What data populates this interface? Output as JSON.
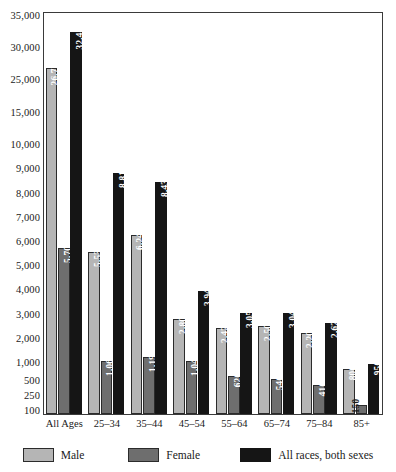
{
  "chart_data": {
    "type": "bar",
    "title": "",
    "subtitle": "",
    "xlabel": "",
    "ylabel": "",
    "grid": false,
    "legend_position": "bottom",
    "axis_note": "Non-linear (broken) y-axis: spacing compresses above 10,000 and expands below 1,000",
    "categories": [
      "All Ages",
      "25–34",
      "35–44",
      "45–54",
      "55–64",
      "65–74",
      "75–84",
      "85+"
    ],
    "ytick_labels": [
      "35,000",
      "30,000",
      "25,000",
      "15,000",
      "10,000",
      "9,000",
      "8,000",
      "7,000",
      "6,000",
      "5,000",
      "4,000",
      "3,000",
      "2,000",
      "1,000",
      "500",
      "250",
      "100"
    ],
    "ytick_values": [
      35000,
      30000,
      25000,
      15000,
      10000,
      9000,
      8000,
      7000,
      6000,
      5000,
      4000,
      3000,
      2000,
      1000,
      500,
      250,
      100
    ],
    "ytick_pixel_y": [
      16,
      48,
      80,
      113,
      145,
      169,
      194,
      218,
      242,
      266,
      290,
      315,
      339,
      363,
      381,
      396,
      411
    ],
    "ylim": [
      0,
      35000
    ],
    "series": [
      {
        "name": "Male",
        "color": "#b5b5b5",
        "values": [
          26710,
          5530,
          6240,
          2800,
          2420,
          2500,
          2200,
          800
        ],
        "value_labels": [
          "26,710",
          "5,530",
          "6,240",
          "2,800",
          "2,420",
          "2,500",
          "2,200",
          "800"
        ]
      },
      {
        "name": "Female",
        "color": "#6e6e6e",
        "values": [
          5700,
          1060,
          1190,
          1040,
          620,
          540,
          410,
          150
        ],
        "value_labels": [
          "5,700",
          "1,060",
          "1,190",
          "1,040",
          "620",
          "540",
          "410",
          "150"
        ]
      },
      {
        "name": "All races, both sexes",
        "color": "#151515",
        "values": [
          32410,
          8810,
          8430,
          3940,
          3050,
          3040,
          2620,
          950
        ],
        "value_labels": [
          "32,410",
          "8,810",
          "8,430",
          "3,940",
          "3,050",
          "3,040",
          "2,620",
          "950"
        ]
      }
    ]
  },
  "legend": {
    "items": [
      {
        "label": "Male",
        "swatch": "male"
      },
      {
        "label": "Female",
        "swatch": "female"
      },
      {
        "label": "All races, both sexes",
        "swatch": "all"
      }
    ]
  }
}
